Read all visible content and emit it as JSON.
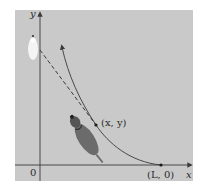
{
  "figure": {
    "panel_color": "#c9c9c9",
    "axis_color": "#3a3a3a",
    "curve_color": "#3a3a3a",
    "axes": {
      "x_label": "x",
      "y_label": "y",
      "origin_label": "0"
    },
    "points": {
      "dog_position_label": "(x, y)",
      "start_label": "(L, 0)"
    },
    "elements": {
      "curve": "pursuit curve",
      "tangent": "dashed tangent line",
      "walker": "person (top view)",
      "dog": "dog (top view)"
    }
  }
}
